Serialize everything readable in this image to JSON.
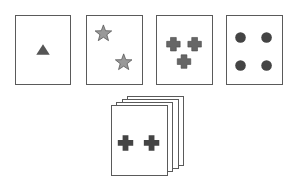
{
  "colors": {
    "card_border": "#5a5a5a",
    "card_fill": "#ffffff",
    "symbol_fill": "#555555",
    "star_fill": "#999999"
  },
  "key_cards": [
    {
      "shape": "triangle",
      "count": 1
    },
    {
      "shape": "star",
      "count": 2
    },
    {
      "shape": "cross",
      "count": 3
    },
    {
      "shape": "circle",
      "count": 4
    }
  ],
  "deck": {
    "top_card": {
      "shape": "cross",
      "count": 2
    },
    "stacked_cards": 4
  }
}
